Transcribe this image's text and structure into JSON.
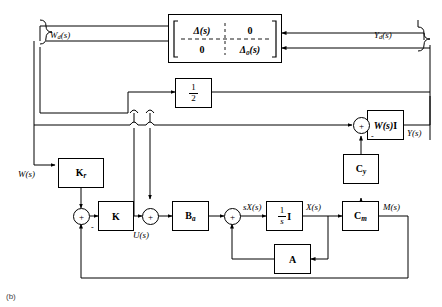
{
  "figure": {
    "caption": "(b)",
    "type": "control-system-block-diagram"
  },
  "blocks": {
    "uncertainty_matrix": {
      "name": "uncertainty-matrix-block",
      "row1_col1": "Δ(s)",
      "row1_col2": "0",
      "row2_col1": "0",
      "row2_col2": "Δ0(s)",
      "row2_col2_base": "Δ",
      "row2_col2_sub": "0",
      "row2_col2_arg": "(s)"
    },
    "half_gain": {
      "name": "half-gain-block",
      "numerator": "1",
      "denominator": "2"
    },
    "wsi": {
      "name": "wsi-block",
      "label": "W(s)I",
      "label_italic": "W(s)",
      "label_bold": "I"
    },
    "kr": {
      "name": "kr-gain-block",
      "base": "K",
      "sub": "r"
    },
    "k": {
      "name": "k-gain-block",
      "base": "K",
      "sub": ""
    },
    "ba": {
      "name": "ba-gain-block",
      "base": "B",
      "sub": "a"
    },
    "integrator": {
      "name": "integrator-block",
      "numerator": "1",
      "denominator": "s",
      "suffix": "I"
    },
    "cm": {
      "name": "cm-gain-block",
      "base": "C",
      "sub": "m"
    },
    "cy": {
      "name": "cy-gain-block",
      "base": "C",
      "sub": "y"
    },
    "a": {
      "name": "a-state-matrix-block",
      "base": "A",
      "sub": ""
    }
  },
  "signals": {
    "wd": "Wd(s)",
    "wd_base": "W",
    "wd_sub": "d",
    "wd_arg": "(s)",
    "yd": "Yd(s)",
    "yd_base": "Y",
    "yd_sub": "d",
    "yd_arg": "(s)",
    "w": "W(s)",
    "y": "Y(s)",
    "u": "U(s)",
    "sx": "sX(s)",
    "x": "X(s)",
    "m": "M(s)"
  },
  "summing_junctions": [
    {
      "name": "sum-error-junction",
      "symbol": "+",
      "signs": [
        "+",
        "-"
      ]
    },
    {
      "name": "sum-control-junction",
      "symbol": "+",
      "signs": [
        "+",
        "+"
      ]
    },
    {
      "name": "sum-state-junction",
      "symbol": "+",
      "signs": [
        "+",
        "+"
      ]
    },
    {
      "name": "sum-output-junction",
      "symbol": "+",
      "signs": [
        "+",
        "-"
      ]
    }
  ],
  "signs": {
    "plus": "+",
    "minus": "-"
  },
  "colors": {
    "line": "#000000",
    "background": "#ffffff",
    "caption": "#444444"
  }
}
